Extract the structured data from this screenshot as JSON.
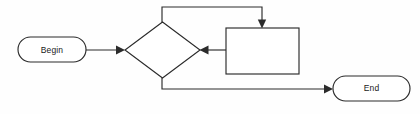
{
  "diagram": {
    "background_color": "#fefefe",
    "stroke_color": "#2b2b2b",
    "fill_color": "#ffffff",
    "text_color": "#1a1a1a",
    "nodes": [
      {
        "id": "begin",
        "type": "terminal",
        "label": "Begin",
        "x": 18,
        "y": 37,
        "width": 68,
        "height": 25,
        "label_x": 52,
        "label_y": 50
      },
      {
        "id": "decision",
        "type": "decision",
        "label": "",
        "x": 125,
        "y": 22,
        "width": 75,
        "height": 56,
        "label_x": 162,
        "label_y": 50
      },
      {
        "id": "process",
        "type": "process",
        "label": "",
        "x": 226,
        "y": 28,
        "width": 73,
        "height": 46,
        "label_x": 262,
        "label_y": 51
      },
      {
        "id": "end",
        "type": "terminal",
        "label": "End",
        "x": 333,
        "y": 76,
        "width": 77,
        "height": 25,
        "label_x": 371,
        "label_y": 88
      }
    ],
    "edges": [
      {
        "id": "begin-to-decision",
        "from": "begin",
        "to": "decision",
        "label": "",
        "path": "M 86 50 L 121 50",
        "arrow_at": "end",
        "arrow_dir": "right",
        "arrow_x": 125,
        "arrow_y": 50
      },
      {
        "id": "decision-to-process-loop",
        "from": "decision",
        "to": "process",
        "label": "",
        "path": "M 162 22 L 162 7 L 262 7 L 262 23",
        "arrow_at": "end",
        "arrow_dir": "down",
        "arrow_x": 262,
        "arrow_y": 28
      },
      {
        "id": "process-to-decision",
        "from": "process",
        "to": "decision",
        "label": "",
        "path": "M 226 50 L 204 50",
        "arrow_at": "end",
        "arrow_dir": "left",
        "arrow_x": 200,
        "arrow_y": 50
      },
      {
        "id": "decision-to-end",
        "from": "decision",
        "to": "end",
        "label": "",
        "path": "M 162 78 L 162 89 L 329 89",
        "arrow_at": "end",
        "arrow_dir": "right",
        "arrow_x": 333,
        "arrow_y": 89
      }
    ]
  }
}
